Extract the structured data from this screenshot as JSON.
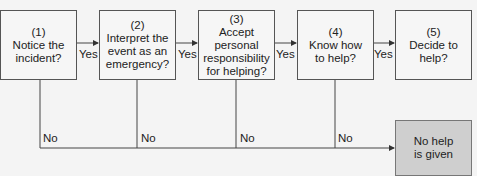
{
  "diagram": {
    "steps": [
      {
        "number": "(1)",
        "text": "Notice the incident?"
      },
      {
        "number": "(2)",
        "text": "Interpret the event as an emergency?"
      },
      {
        "number": "(3)",
        "text": "Accept personal responsibility for helping?"
      },
      {
        "number": "(4)",
        "text": "Know how to help?"
      },
      {
        "number": "(5)",
        "text": "Decide to help?"
      }
    ],
    "yes_labels": [
      "Yes",
      "Yes",
      "Yes",
      "Yes"
    ],
    "no_labels": [
      "No",
      "No",
      "No",
      "No"
    ],
    "outcome": {
      "text": "No help is given"
    },
    "colors": {
      "line": "#444444",
      "box_fill": "#f6f6f6",
      "outcome_fill": "#cfcfcf"
    }
  }
}
